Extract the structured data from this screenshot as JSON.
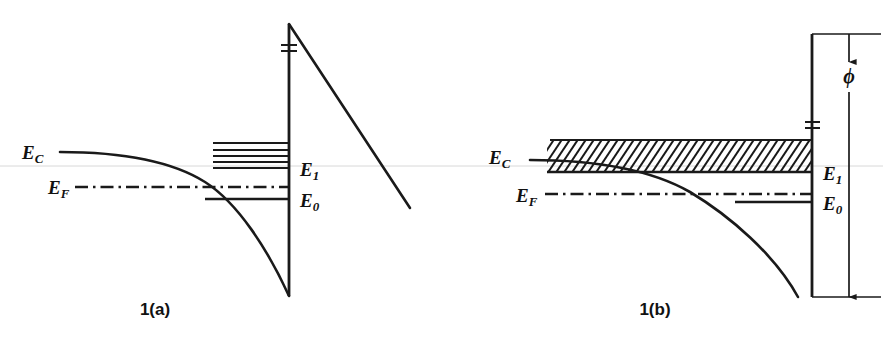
{
  "figure": {
    "background_color": "#ffffff",
    "ink_color": "#1a1a1a",
    "scanline_color": "#d8d8d8",
    "panels": [
      {
        "id": "panel-a",
        "caption": "1(a)",
        "caption_x": 155,
        "caption_y": 315,
        "barrier_x": 289,
        "barrier_top_y": 24,
        "barrier_bottom_y": 296,
        "barrier_break_y": 48,
        "labels": {
          "ec": "E",
          "ec_sub": "C",
          "ef": "E",
          "ef_sub": "F",
          "e1": "E",
          "e1_sub": "1",
          "e0": "E",
          "e0_sub": "0"
        },
        "label_positions": {
          "ec_x": 22,
          "ec_y": 155,
          "ef_x": 48,
          "ef_y": 190,
          "e1_x": 300,
          "e1_y": 172,
          "e0_x": 300,
          "e0_y": 203
        },
        "levels": {
          "e1_y": 168,
          "e0_y": 199,
          "e0_line_x_start": 205,
          "ef_y": 187,
          "ef_x_start": 75,
          "ec_tail_y": 152,
          "ec_tail_x_start": 60
        },
        "ladder": {
          "description": "discrete quantized sub-levels above E1",
          "x_start": 213,
          "x_end": 289,
          "line_count": 5,
          "y_values": [
            143,
            150,
            156,
            162,
            168
          ]
        },
        "vacuum_slope": {
          "x_start": 289,
          "y_start": 24,
          "x_end": 410,
          "y_end": 208
        }
      },
      {
        "id": "panel-b",
        "caption": "1(b)",
        "caption_x": 655,
        "caption_y": 315,
        "barrier_x": 812,
        "barrier_top_y": 34,
        "barrier_bottom_y": 297,
        "barrier_break_y": 125,
        "labels": {
          "ec": "E",
          "ec_sub": "C",
          "ef": "E",
          "ef_sub": "F",
          "e1": "E",
          "e1_sub": "1",
          "e0": "E",
          "e0_sub": "0",
          "phi": "ϕ"
        },
        "label_positions": {
          "ec_x": 489,
          "ec_y": 160,
          "ef_x": 516,
          "ef_y": 198,
          "e1_x": 823,
          "e1_y": 176,
          "e0_x": 823,
          "e0_y": 206,
          "phi_x": 849,
          "phi_y": 77
        },
        "levels": {
          "e1_y": 172,
          "e0_y": 202,
          "e0_line_x_start": 735,
          "ef_y": 194,
          "ef_x_start": 545,
          "ec_tail_y": 160,
          "ec_tail_x_start": 530
        },
        "hatch_band": {
          "description": "hatched continuum band above E1",
          "x_start": 547,
          "x_end": 812,
          "top_y": 140,
          "bottom_y": 172,
          "stripe_count": 34,
          "stripe_angle_deg": -40
        },
        "dimension": {
          "symbol": "ϕ",
          "axis_x": 849,
          "top_y": 34,
          "bottom_y": 297,
          "top_tick_x_start": 812,
          "top_tick_x_end": 881,
          "bottom_tick_x_start": 812,
          "bottom_tick_x_end": 881
        }
      }
    ],
    "scan_artifact": {
      "description": "faint horizontal scanner line across page",
      "y": 166
    }
  }
}
